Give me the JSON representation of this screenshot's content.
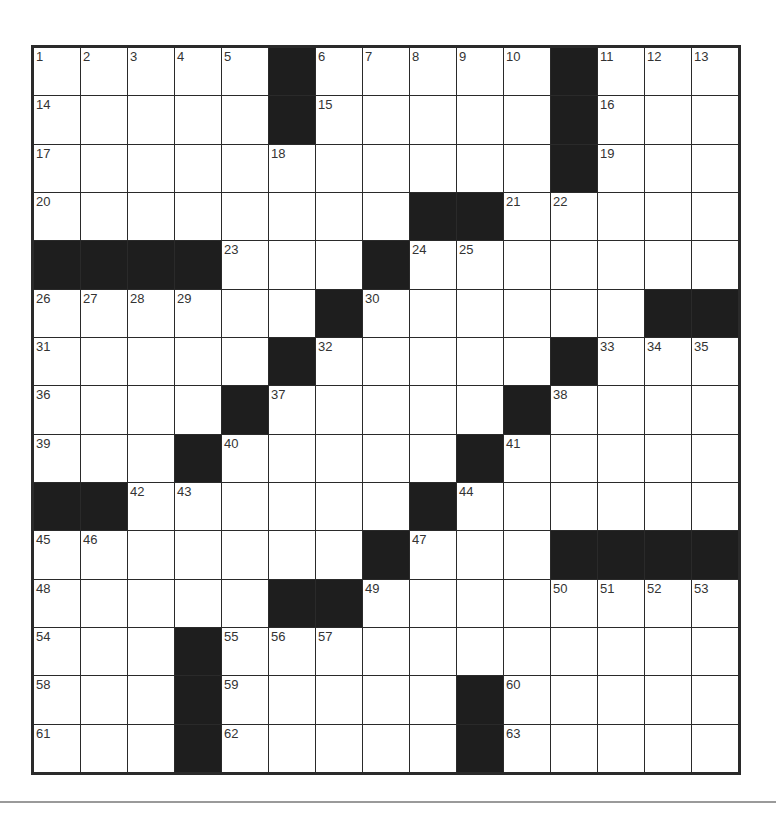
{
  "puzzle": {
    "size": 15,
    "rows": [
      ".....#.....#...",
      ".....#.....#...",
      "...........#...",
      "........##.....",
      "####...#.......",
      "......#......##",
      ".....#.....#...",
      "....#.....#....",
      "...#.....#.....",
      "##......#......",
      ".......#...####",
      ".....##........",
      "...#...........",
      "...#.....#.....",
      "...#.....#....."
    ],
    "numbers": [
      {
        "r": 0,
        "c": 0,
        "n": "1"
      },
      {
        "r": 0,
        "c": 1,
        "n": "2"
      },
      {
        "r": 0,
        "c": 2,
        "n": "3"
      },
      {
        "r": 0,
        "c": 3,
        "n": "4"
      },
      {
        "r": 0,
        "c": 4,
        "n": "5"
      },
      {
        "r": 0,
        "c": 6,
        "n": "6"
      },
      {
        "r": 0,
        "c": 7,
        "n": "7"
      },
      {
        "r": 0,
        "c": 8,
        "n": "8"
      },
      {
        "r": 0,
        "c": 9,
        "n": "9"
      },
      {
        "r": 0,
        "c": 10,
        "n": "10"
      },
      {
        "r": 0,
        "c": 12,
        "n": "11"
      },
      {
        "r": 0,
        "c": 13,
        "n": "12"
      },
      {
        "r": 0,
        "c": 14,
        "n": "13"
      },
      {
        "r": 1,
        "c": 0,
        "n": "14"
      },
      {
        "r": 1,
        "c": 6,
        "n": "15"
      },
      {
        "r": 1,
        "c": 12,
        "n": "16"
      },
      {
        "r": 2,
        "c": 0,
        "n": "17"
      },
      {
        "r": 2,
        "c": 5,
        "n": "18"
      },
      {
        "r": 2,
        "c": 12,
        "n": "19"
      },
      {
        "r": 3,
        "c": 0,
        "n": "20"
      },
      {
        "r": 3,
        "c": 10,
        "n": "21"
      },
      {
        "r": 3,
        "c": 11,
        "n": "22"
      },
      {
        "r": 4,
        "c": 4,
        "n": "23"
      },
      {
        "r": 4,
        "c": 8,
        "n": "24"
      },
      {
        "r": 4,
        "c": 9,
        "n": "25"
      },
      {
        "r": 5,
        "c": 0,
        "n": "26"
      },
      {
        "r": 5,
        "c": 1,
        "n": "27"
      },
      {
        "r": 5,
        "c": 2,
        "n": "28"
      },
      {
        "r": 5,
        "c": 3,
        "n": "29"
      },
      {
        "r": 5,
        "c": 7,
        "n": "30"
      },
      {
        "r": 6,
        "c": 0,
        "n": "31"
      },
      {
        "r": 6,
        "c": 6,
        "n": "32"
      },
      {
        "r": 6,
        "c": 12,
        "n": "33"
      },
      {
        "r": 6,
        "c": 13,
        "n": "34"
      },
      {
        "r": 6,
        "c": 14,
        "n": "35"
      },
      {
        "r": 7,
        "c": 0,
        "n": "36"
      },
      {
        "r": 7,
        "c": 5,
        "n": "37"
      },
      {
        "r": 7,
        "c": 11,
        "n": "38"
      },
      {
        "r": 8,
        "c": 0,
        "n": "39"
      },
      {
        "r": 8,
        "c": 4,
        "n": "40"
      },
      {
        "r": 8,
        "c": 10,
        "n": "41"
      },
      {
        "r": 9,
        "c": 2,
        "n": "42"
      },
      {
        "r": 9,
        "c": 3,
        "n": "43"
      },
      {
        "r": 9,
        "c": 9,
        "n": "44"
      },
      {
        "r": 10,
        "c": 0,
        "n": "45"
      },
      {
        "r": 10,
        "c": 1,
        "n": "46"
      },
      {
        "r": 10,
        "c": 8,
        "n": "47"
      },
      {
        "r": 11,
        "c": 0,
        "n": "48"
      },
      {
        "r": 11,
        "c": 7,
        "n": "49"
      },
      {
        "r": 11,
        "c": 11,
        "n": "50"
      },
      {
        "r": 11,
        "c": 12,
        "n": "51"
      },
      {
        "r": 11,
        "c": 13,
        "n": "52"
      },
      {
        "r": 11,
        "c": 14,
        "n": "53"
      },
      {
        "r": 12,
        "c": 0,
        "n": "54"
      },
      {
        "r": 12,
        "c": 4,
        "n": "55"
      },
      {
        "r": 12,
        "c": 5,
        "n": "56"
      },
      {
        "r": 12,
        "c": 6,
        "n": "57"
      },
      {
        "r": 13,
        "c": 0,
        "n": "58"
      },
      {
        "r": 13,
        "c": 4,
        "n": "59"
      },
      {
        "r": 13,
        "c": 10,
        "n": "60"
      },
      {
        "r": 14,
        "c": 0,
        "n": "61"
      },
      {
        "r": 14,
        "c": 4,
        "n": "62"
      },
      {
        "r": 14,
        "c": 10,
        "n": "63"
      }
    ],
    "colors": {
      "black_square": "#1e1e1e",
      "white_square": "#ffffff",
      "grid_line": "#2a2a2a",
      "number_text": "#333333",
      "bottom_rule": "#9a9a9a"
    }
  }
}
